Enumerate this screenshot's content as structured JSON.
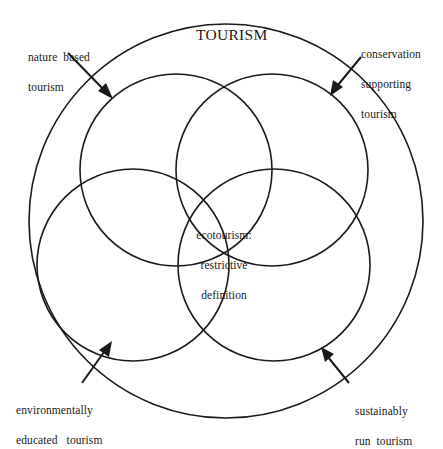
{
  "diagram": {
    "title": "TOURISM",
    "center_label": {
      "line1": "ecotourism:",
      "line2": "restrictive",
      "line3": "definition"
    },
    "labels": {
      "nature_based": {
        "line1": "nature  based",
        "line2": "tourism"
      },
      "conservation_supporting": {
        "line1": "conservation",
        "line2": "supporting",
        "line3": "tourism"
      },
      "environmentally_educated": {
        "line1": "environmentally",
        "line2": "educated   tourism"
      },
      "sustainably_run": {
        "line1": "sustainably",
        "line2": "run  tourism"
      }
    },
    "colors": {
      "stroke": "#1a1a1a",
      "background": "#ffffff"
    },
    "shapes": {
      "outer_circle": {
        "cx": 226,
        "cy": 221,
        "r": 197
      },
      "inner_circles": [
        {
          "name": "nature-based-circle",
          "cx": 176,
          "cy": 170,
          "r": 96
        },
        {
          "name": "conservation-supporting-circle",
          "cx": 272,
          "cy": 170,
          "r": 96
        },
        {
          "name": "environmentally-educated-circle",
          "cx": 133,
          "cy": 265,
          "r": 96
        },
        {
          "name": "sustainably-run-circle",
          "cx": 274,
          "cy": 265,
          "r": 96
        }
      ]
    }
  }
}
